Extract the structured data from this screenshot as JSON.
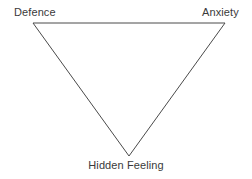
{
  "diagram": {
    "type": "triangle",
    "background_color": "#ffffff",
    "stroke_color": "#4a4a4a",
    "stroke_width": 1,
    "text_color": "#3a3a3a",
    "orientation": "inverted",
    "vertices": [
      {
        "id": "top-left",
        "label": "Defence",
        "x": 33,
        "y": 23
      },
      {
        "id": "top-right",
        "label": "Anxiety",
        "x": 225,
        "y": 23
      },
      {
        "id": "bottom",
        "label": "Hidden Feeling",
        "x": 129,
        "y": 156
      }
    ],
    "edges": [
      {
        "from": "top-left",
        "to": "top-right"
      },
      {
        "from": "top-right",
        "to": "bottom"
      },
      {
        "from": "bottom",
        "to": "top-left"
      }
    ],
    "labels": {
      "defence": "Defence",
      "anxiety": "Anxiety",
      "hidden_feeling": "Hidden Feeling"
    }
  }
}
